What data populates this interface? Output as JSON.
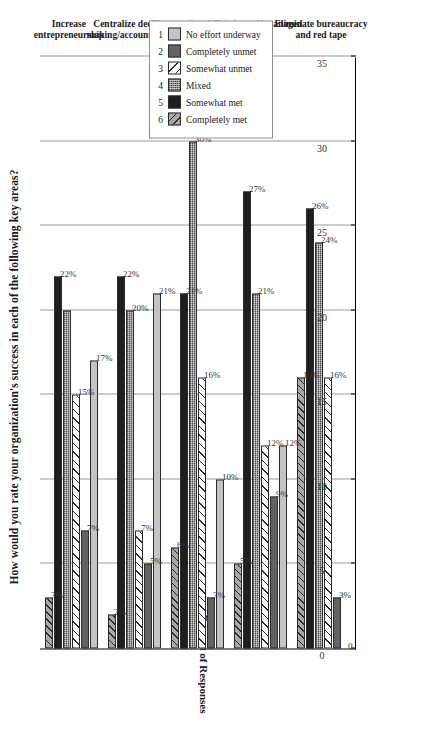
{
  "chart_data": {
    "type": "bar",
    "orientation": "horizontal",
    "title": "How would you rate your organization's success in each of the following key areas?",
    "xlabel": "",
    "ylabel": "Percent of Responses",
    "ylim": [
      0,
      35
    ],
    "grid": true,
    "legend_position": "top-right",
    "tick_labels": [
      "0",
      "5",
      "10",
      "15",
      "20",
      "25",
      "30",
      "35"
    ],
    "ticks": [
      0,
      5,
      10,
      15,
      20,
      25,
      30,
      35
    ],
    "categories": [
      "Eliminate bureaucracy\nand red tape",
      "Develop self-managed\nteams",
      "Decentralize decision\nmaking/accountability",
      "Centralize decision\nmaking/accountability",
      "Increase\nentrepreneurship"
    ],
    "group_label": "Decision Making and Problem Solving",
    "series": [
      {
        "name": "1  No effort underway",
        "num": "1",
        "label": "No effort underway",
        "values": [
          0,
          12,
          10,
          21,
          17
        ],
        "value_labels": [
          "0",
          "12%",
          "10%",
          "21%",
          "17%"
        ]
      },
      {
        "name": "2  Completely unmet",
        "num": "2",
        "label": "Completely unmet",
        "values": [
          3,
          9,
          3,
          5,
          7
        ],
        "value_labels": [
          "3%",
          "9%",
          "3%",
          "5%",
          "7%"
        ]
      },
      {
        "name": "3  Somewhat unmet",
        "num": "3",
        "label": "Somewhat unmet",
        "values": [
          16,
          12,
          16,
          7,
          15
        ],
        "value_labels": [
          "16%",
          "12%",
          "16%",
          "7%",
          "15%"
        ]
      },
      {
        "name": "4  Mixed",
        "num": "4",
        "label": "Mixed",
        "values": [
          24,
          21,
          30,
          20,
          20
        ],
        "value_labels": [
          "24%",
          "21%",
          "30%",
          "20%",
          ""
        ]
      },
      {
        "name": "5  Somewhat met",
        "num": "5",
        "label": "Somewhat met",
        "values": [
          26,
          27,
          21,
          22,
          22
        ],
        "value_labels": [
          "26%",
          "27%",
          "21%",
          "22%",
          "22%"
        ]
      },
      {
        "name": "6  Completely met",
        "num": "6",
        "label": "Completely met",
        "values": [
          16,
          5,
          6,
          2,
          3
        ],
        "value_labels": [
          "16%",
          "5%",
          "6%",
          "2%",
          "3%"
        ]
      }
    ],
    "series_colors": [
      "#c4c4c4",
      "#636363",
      "#ffffff",
      "#8a8a8a",
      "#1e1e1e",
      "#a8a8a8"
    ]
  },
  "legend": {
    "items": [
      {
        "num": "1",
        "label": "No effort underway"
      },
      {
        "num": "2",
        "label": "Completely unmet"
      },
      {
        "num": "3",
        "label": "Somewhat unmet"
      },
      {
        "num": "4",
        "label": "Mixed"
      },
      {
        "num": "5",
        "label": "Somewhat met"
      },
      {
        "num": "6",
        "label": "Completely met"
      }
    ]
  },
  "axis": {
    "y_title": "Percent of Responses"
  }
}
